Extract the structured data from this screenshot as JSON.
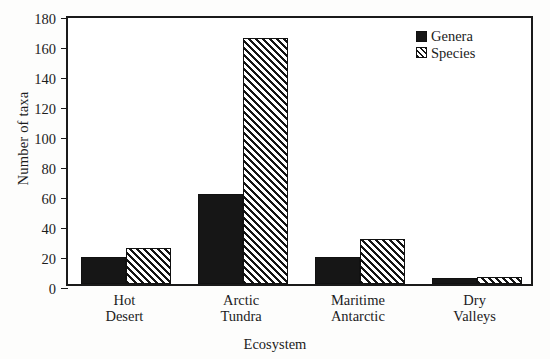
{
  "chart_data": {
    "type": "bar",
    "title": "",
    "xlabel": "Ecosystem",
    "ylabel": "Number of taxa",
    "categories": [
      [
        "Hot",
        "Desert"
      ],
      [
        "Arctic",
        "Tundra"
      ],
      [
        "Maritime",
        "Antarctic"
      ],
      [
        "Dry",
        "Valleys"
      ]
    ],
    "category_labels": [
      "Hot Desert",
      "Arctic Tundra",
      "Maritime Antarctic",
      "Dry Valleys"
    ],
    "series": [
      {
        "name": "Genera",
        "values": [
          18,
          60,
          18,
          4
        ],
        "style": "solid-black",
        "color": "#161616"
      },
      {
        "name": "Species",
        "values": [
          24,
          164,
          30,
          5
        ],
        "style": "diagonal-hatch",
        "color": "#141414"
      }
    ],
    "ylim": [
      0,
      180
    ],
    "yticks": [
      0,
      20,
      40,
      60,
      80,
      100,
      120,
      140,
      160,
      180
    ],
    "grid": false,
    "legend_position": "top-right-inside",
    "frame": "full-box"
  }
}
